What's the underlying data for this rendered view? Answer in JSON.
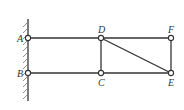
{
  "diagram": {
    "type": "truss-structure",
    "support": {
      "type": "fixed-wall",
      "side": "left"
    },
    "nodes": [
      {
        "id": "A",
        "label": "A",
        "x": 28,
        "y": 38,
        "label_pos": "left"
      },
      {
        "id": "B",
        "label": "B",
        "x": 28,
        "y": 73,
        "label_pos": "left"
      },
      {
        "id": "D",
        "label": "D",
        "x": 101,
        "y": 38,
        "label_pos": "above"
      },
      {
        "id": "C",
        "label": "C",
        "x": 101,
        "y": 73,
        "label_pos": "below"
      },
      {
        "id": "F",
        "label": "F",
        "x": 171,
        "y": 38,
        "label_pos": "above"
      },
      {
        "id": "E",
        "label": "E",
        "x": 171,
        "y": 73,
        "label_pos": "below"
      }
    ],
    "members": [
      [
        "A",
        "D"
      ],
      [
        "D",
        "F"
      ],
      [
        "B",
        "C"
      ],
      [
        "C",
        "E"
      ],
      [
        "D",
        "C"
      ],
      [
        "F",
        "E"
      ],
      [
        "D",
        "E"
      ]
    ]
  }
}
